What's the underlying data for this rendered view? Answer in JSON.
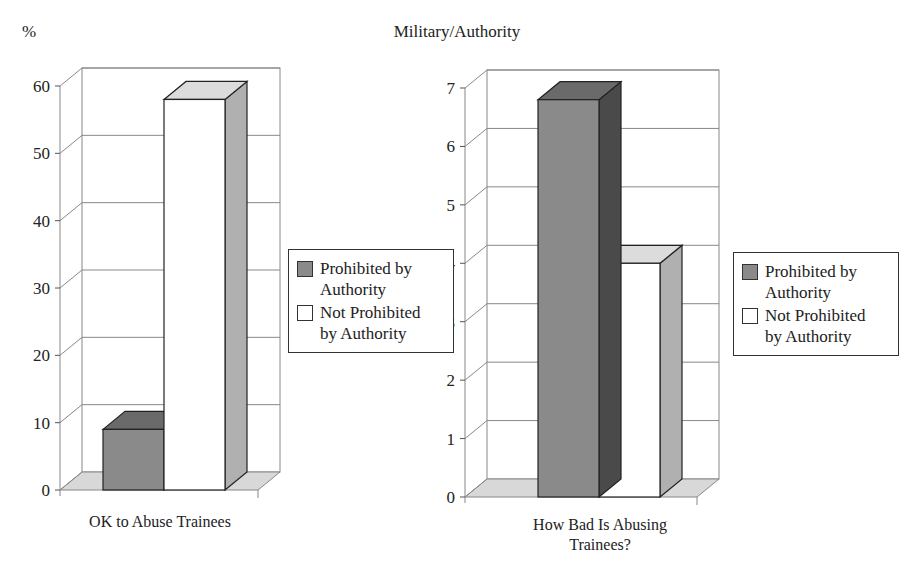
{
  "title": "Military/Authority",
  "y_unit_label": "%",
  "colors": {
    "prohibited": "#8a8a8a",
    "prohibited_top": "#6a6a6a",
    "prohibited_side": "#4a4a4a",
    "not_prohibited": "#ffffff",
    "not_prohibited_top": "#dcdcdc",
    "not_prohibited_side": "#b0b0b0",
    "floor": "#d8d8d8",
    "grid": "#888888"
  },
  "legend": {
    "items": [
      {
        "label_line1": "Prohibited by",
        "label_line2": "Authority",
        "swatch": "#8a8a8a"
      },
      {
        "label_line1": "Not Prohibited",
        "label_line2": "by Authority",
        "swatch": "#ffffff"
      }
    ]
  },
  "chart_data": [
    {
      "type": "bar",
      "title": "",
      "xlabel": "OK to Abuse Trainees",
      "ylabel": "%",
      "categories": [
        "OK to Abuse Trainees"
      ],
      "ylim": [
        0,
        60
      ],
      "yticks": [
        0,
        10,
        20,
        30,
        40,
        50,
        60
      ],
      "grid": true,
      "three_d": true,
      "legend_position": "right",
      "series": [
        {
          "name": "Prohibited by Authority",
          "values": [
            9
          ]
        },
        {
          "name": "Not Prohibited by Authority",
          "values": [
            58
          ]
        }
      ]
    },
    {
      "type": "bar",
      "title": "",
      "xlabel": "How Bad Is Abusing Trainees?",
      "ylabel": "",
      "categories": [
        "How Bad Is Abusing Trainees?"
      ],
      "ylim": [
        0,
        7
      ],
      "yticks": [
        0,
        1,
        2,
        3,
        4,
        5,
        6,
        7
      ],
      "grid": true,
      "three_d": true,
      "legend_position": "right",
      "series": [
        {
          "name": "Prohibited by Authority",
          "values": [
            6.8
          ]
        },
        {
          "name": "Not Prohibited by Authority",
          "values": [
            4.0
          ]
        }
      ]
    }
  ],
  "charts": [
    {
      "xlabel_line1": "OK to Abuse Trainees",
      "xlabel_line2": ""
    },
    {
      "xlabel_line1": "How Bad Is Abusing",
      "xlabel_line2": "Trainees?"
    }
  ]
}
